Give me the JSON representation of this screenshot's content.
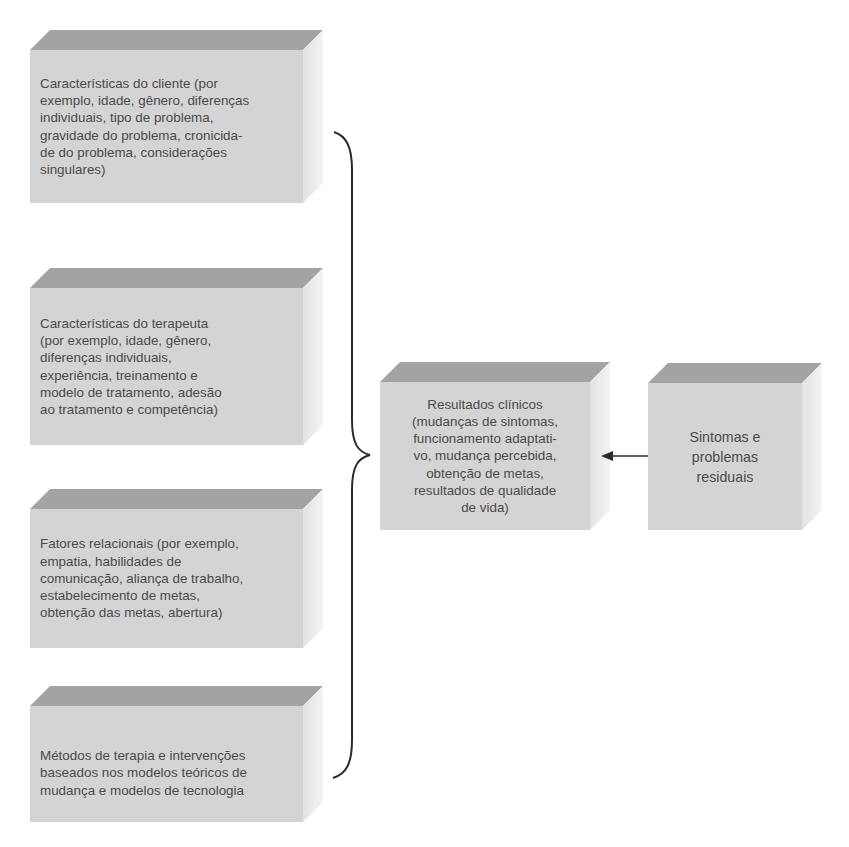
{
  "colors": {
    "box_front": "#d4d4d4",
    "box_top": "#a3a3a3",
    "box_side": "#ececec",
    "text": "#4a4a4a",
    "lines": "#2b2b2b"
  },
  "boxes": {
    "client": {
      "text": "Características do cliente (por\nexemplo, idade, gênero, diferenças\nindividuais, tipo de problema,\ngravidade do problema, cronicida-\nde do problema, considerações\nsingulares)"
    },
    "therapist": {
      "text": "Características do terapeuta\n(por exemplo, idade, gênero,\ndiferenças individuais,\nexperiência, treinamento e\nmodelo de tratamento, adesão\nao tratamento e competência)"
    },
    "relational": {
      "text": "Fatores relacionais (por exemplo,\nempatia, habilidades de\ncomunicação, aliança de trabalho,\nestabelecimento de metas,\nobtenção das metas, abertura)"
    },
    "methods": {
      "text": "Métodos de terapia e intervenções\nbaseados nos modelos teóricos de\nmudança e modelos de tecnologia"
    },
    "outcomes": {
      "text": "Resultados clínicos\n(mudanças de sintomas,\nfuncionamento adaptati-\nvo, mudança percebida,\nobtenção de metas,\nresultados de qualidade\nde vida)"
    },
    "residual": {
      "text": "Sintomas e\nproblemas\nresiduais"
    }
  },
  "connectors": {
    "brace": "groups the four left factors into clinical outcomes",
    "arrow": "from residual symptoms to clinical outcomes"
  }
}
